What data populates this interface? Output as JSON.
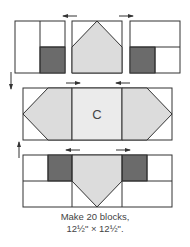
{
  "diagram": {
    "type": "quilt-block-assembly",
    "colors": {
      "outline": "#333333",
      "dark": "#6b6b6b",
      "light": "#dcdcdc",
      "center": "#ebebeb",
      "white": "#ffffff",
      "arrow": "#333333"
    },
    "rows": [
      {
        "name": "top-row",
        "units": [
          "corner-unit-left",
          "flying-geese-up",
          "corner-unit-right"
        ],
        "pressing_arrows": [
          "left",
          "right"
        ]
      },
      {
        "name": "middle-row",
        "units": [
          "flying-geese-left",
          "center-square",
          "flying-geese-right"
        ],
        "center_label": "C",
        "pressing_arrows": [
          "right",
          "left"
        ]
      },
      {
        "name": "bottom-row",
        "units": [
          "corner-unit-left",
          "flying-geese-down",
          "corner-unit-right"
        ],
        "pressing_arrows": [
          "left",
          "right"
        ]
      }
    ],
    "row_join_arrows": [
      "down",
      "up"
    ]
  },
  "caption": {
    "line1": "Make 20 blocks,",
    "line2": "12½\" × 12½\"."
  }
}
